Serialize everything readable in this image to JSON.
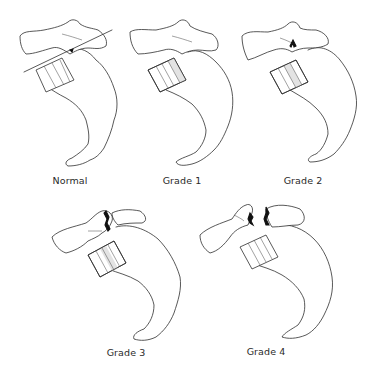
{
  "figure": {
    "panels": [
      {
        "id": "normal",
        "label": "Normal",
        "slip": 0
      },
      {
        "id": "grade1",
        "label": "Grade 1",
        "slip": 1
      },
      {
        "id": "grade2",
        "label": "Grade 2",
        "slip": 2
      },
      {
        "id": "grade3",
        "label": "Grade 3",
        "slip": 3
      },
      {
        "id": "grade4",
        "label": "Grade 4",
        "slip": 4
      }
    ],
    "colors": {
      "outline": "#2e2e2e",
      "shading": "#e3e3e3",
      "defect": "#111111",
      "background": "#ffffff"
    }
  }
}
